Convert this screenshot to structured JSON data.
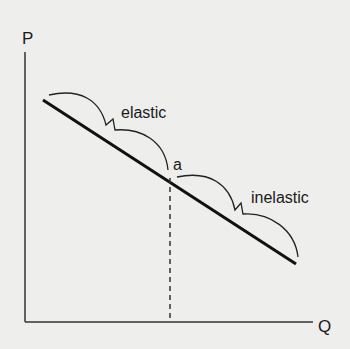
{
  "diagram": {
    "type": "demand-curve-elasticity",
    "axes": {
      "y_label": "P",
      "x_label": "Q"
    },
    "point_label": "a",
    "segments": [
      {
        "label": "elastic"
      },
      {
        "label": "inelastic"
      }
    ],
    "colors": {
      "background": "#eeeeec",
      "ink": "#1a1a1a"
    }
  }
}
